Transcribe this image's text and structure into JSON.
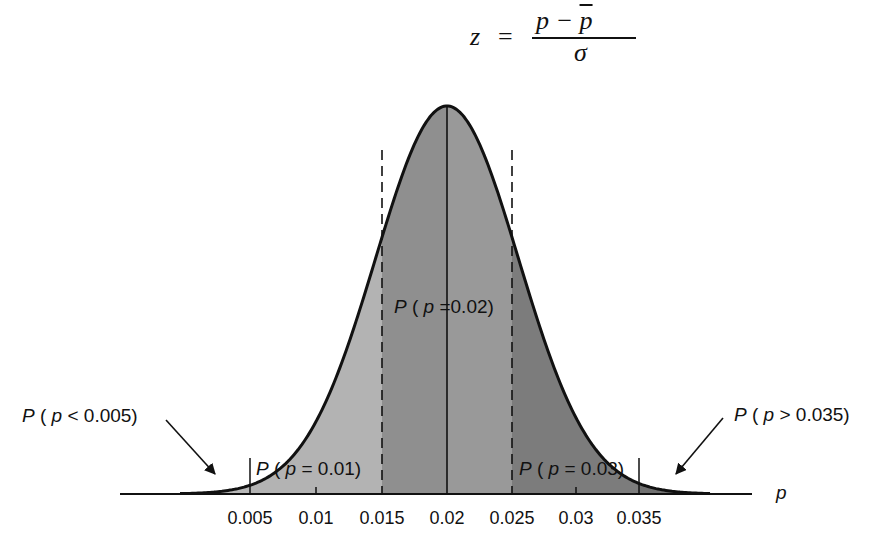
{
  "formula": {
    "lhs": "z",
    "eq": "=",
    "numerator": "p − ",
    "numerator_bar": "p",
    "denominator": "σ"
  },
  "chart_data": {
    "type": "area",
    "xlabel": "p",
    "ylabel": "",
    "distribution": "normal",
    "mean": 0.02,
    "sd_estimate": 0.0055,
    "x_ticks": [
      0.005,
      0.01,
      0.015,
      0.02,
      0.025,
      0.03,
      0.035
    ],
    "x_tick_labels": [
      "0.005",
      "0.01",
      "0.015",
      "0.02",
      "0.025",
      "0.03",
      "0.035"
    ],
    "xlim": [
      0.0,
      0.045
    ],
    "grid": false,
    "regions": [
      {
        "name": "P(p<0.005)",
        "from": null,
        "to": 0.005,
        "shade": "#b8b8b8"
      },
      {
        "name": "P(p=0.01)",
        "from": 0.005,
        "to": 0.015,
        "shade": "#b3b3b3"
      },
      {
        "name": "P(p=0.02)",
        "from": 0.015,
        "to": 0.025,
        "shade": "#939393"
      },
      {
        "name": "P(p=0.03)",
        "from": 0.025,
        "to": 0.035,
        "shade": "#7c7c7c"
      },
      {
        "name": "P(p>0.035)",
        "from": 0.035,
        "to": null,
        "shade": "#6e6e6e"
      }
    ],
    "annotations": [
      "P ( p < 0.005)",
      "P ( p = 0.01)",
      "P ( p =0.02)",
      "P ( p = 0.03)",
      "P ( p > 0.035)"
    ]
  },
  "labels": {
    "left_tail": {
      "P": "P",
      "open": " ( ",
      "p": "p",
      "rest": " < 0.005)"
    },
    "region_01": {
      "P": "P",
      "open": " ( ",
      "p": "p",
      "rest": " = 0.01)"
    },
    "region_02": {
      "P": "P",
      "open": " ( ",
      "p": "p",
      "rest": " =0.02)"
    },
    "region_03": {
      "P": "P",
      "open": " ( ",
      "p": "p",
      "rest": " = 0.03)"
    },
    "right_tail": {
      "P": "P",
      "open": " ( ",
      "p": "p",
      "rest": " > 0.035)"
    },
    "axis_p": "p"
  },
  "ticks": [
    "0.005",
    "0.01",
    "0.015",
    "0.02",
    "0.025",
    "0.03",
    "0.035"
  ]
}
